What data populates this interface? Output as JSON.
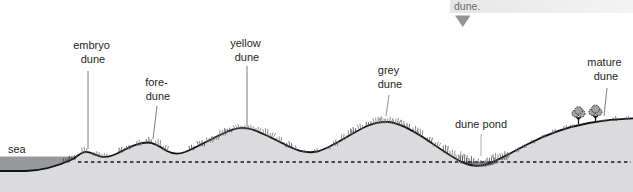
{
  "callout": {
    "text": "dune."
  },
  "labels": {
    "sea": "sea",
    "embryo_line1": "embryo",
    "embryo_line2": "dune",
    "fore_line1": "fore-",
    "fore_line2": "dune",
    "yellow_line1": "yellow",
    "yellow_line2": "dune",
    "grey_line1": "grey",
    "grey_line2": "dune",
    "pond": "dune pond",
    "mature_line1": "mature",
    "mature_line2": "dune"
  },
  "colors": {
    "land": "#dbdbdd",
    "sea": "#97999c",
    "pond": "#8e9094",
    "profile_line": "#141414",
    "dashed_line": "#1a1a1a",
    "leader": "#6e6e6e",
    "leader_light": "#9a9a9a",
    "label_text": "#1f1f1f",
    "callout_text": "#6a6a6a",
    "callout_bg_left": "#e6e6e6",
    "callout_bg_right": "#f4f4f4",
    "triangle": "#909295",
    "grass": "#6e6e6e",
    "grass_dark": "#3d3d3d",
    "tree_foliage": "#a2a2a5",
    "tree_outline": "#2b2b2b",
    "tree_trunk": "#1a1a1a"
  }
}
